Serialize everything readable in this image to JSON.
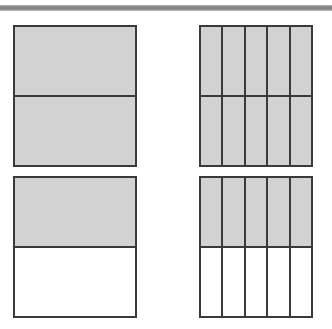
{
  "figure": {
    "rule": {
      "name": "horizontal rule",
      "color": "#8e8e8e"
    },
    "colors": {
      "shaded_fill": "#d2d2d2",
      "unshaded_fill": "#ffffff",
      "line": "#3a3a3a",
      "rule": "#8e8e8e"
    },
    "models": [
      {
        "id": "top-left",
        "label": "2/2",
        "columns": 1,
        "rows": 2,
        "total_parts": 2,
        "shaded_parts": 2,
        "fraction_numerator": "2",
        "fraction_denominator": "2",
        "value": "1",
        "cells": [
          [
            "shaded",
            "shaded"
          ]
        ]
      },
      {
        "id": "top-right",
        "label": "10/10",
        "columns": 5,
        "rows": 2,
        "total_parts": 10,
        "shaded_parts": 10,
        "fraction_numerator": "10",
        "fraction_denominator": "10",
        "value": "1",
        "cells": [
          [
            "shaded",
            "shaded"
          ],
          [
            "shaded",
            "shaded"
          ],
          [
            "shaded",
            "shaded"
          ],
          [
            "shaded",
            "shaded"
          ],
          [
            "shaded",
            "shaded"
          ]
        ]
      },
      {
        "id": "bottom-left",
        "label": "1/2",
        "columns": 1,
        "rows": 2,
        "total_parts": 2,
        "shaded_parts": 1,
        "fraction_numerator": "1",
        "fraction_denominator": "2",
        "value": "0.5",
        "cells": [
          [
            "shaded",
            "unshaded"
          ]
        ]
      },
      {
        "id": "bottom-right",
        "label": "5/10",
        "columns": 5,
        "rows": 2,
        "total_parts": 10,
        "shaded_parts": 5,
        "fraction_numerator": "5",
        "fraction_denominator": "10",
        "value": "0.5",
        "cells": [
          [
            "shaded",
            "unshaded"
          ],
          [
            "shaded",
            "unshaded"
          ],
          [
            "shaded",
            "unshaded"
          ],
          [
            "shaded",
            "unshaded"
          ],
          [
            "shaded",
            "unshaded"
          ]
        ]
      }
    ]
  }
}
